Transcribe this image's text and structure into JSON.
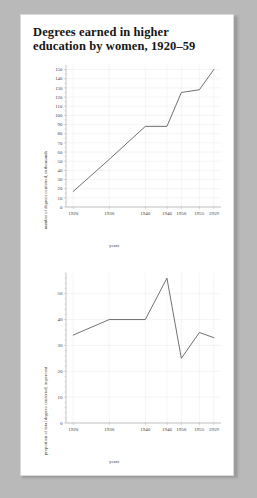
{
  "document": {
    "title": "Degrees earned in higher education by women, 1920–59"
  },
  "chart_data": [
    {
      "type": "line",
      "title": "Degrees earned in higher education by women, 1920–59",
      "xlabel": "years",
      "ylabel": "number of degrees conferred, in thousands",
      "x": [
        1920,
        1930,
        1940,
        1946,
        1950,
        1955,
        1959
      ],
      "xticklabels": [
        "1920",
        "1930",
        "1940",
        "1946",
        "1950",
        "1955",
        "1959"
      ],
      "values": [
        17,
        52,
        88,
        88,
        125,
        128,
        150
      ],
      "yticks": [
        0,
        10,
        20,
        30,
        40,
        50,
        60,
        70,
        80,
        90,
        100,
        110,
        120,
        130,
        140,
        150
      ],
      "yticklabels": [
        "0",
        "10",
        "20",
        "30",
        "40",
        "50",
        "60",
        "70",
        "80",
        "90",
        "100",
        "110",
        "120",
        "130",
        "140",
        "150"
      ],
      "ylim": [
        0,
        155
      ],
      "xlim": [
        1918,
        1961
      ],
      "grid": true,
      "legend": "none"
    },
    {
      "type": "line",
      "title": "",
      "xlabel": "years",
      "ylabel": "proportion of total degrees conferred, in percent",
      "x": [
        1920,
        1930,
        1940,
        1946,
        1950,
        1955,
        1959
      ],
      "xticklabels": [
        "1920",
        "1930",
        "1940",
        "1946",
        "1950",
        "1955",
        "1959"
      ],
      "values": [
        34,
        40,
        40,
        56,
        25,
        35,
        33
      ],
      "yticks": [
        0,
        10,
        20,
        30,
        40,
        50
      ],
      "yticklabels": [
        "0",
        "10",
        "20",
        "30",
        "40",
        "50"
      ],
      "yminorstep": 2,
      "ylim": [
        0,
        58
      ],
      "xlim": [
        1918,
        1961
      ],
      "grid": true,
      "legend": "none"
    }
  ]
}
